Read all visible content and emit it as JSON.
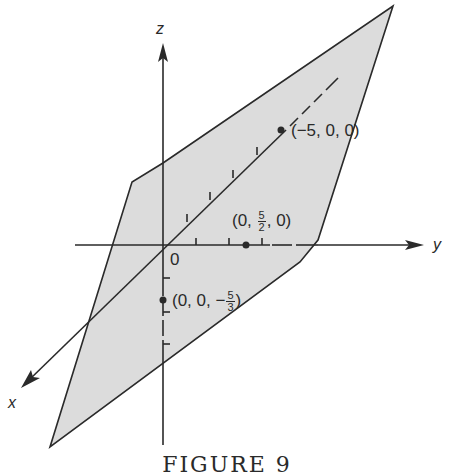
{
  "figure": {
    "caption": "FIGURE 9",
    "colors": {
      "plane_fill": "#dcdcdc",
      "line": "#2a2a2a",
      "background": "#ffffff"
    },
    "axes": {
      "x": {
        "label": "x"
      },
      "y": {
        "label": "y"
      },
      "z": {
        "label": "z"
      }
    },
    "origin_label": "0",
    "points": [
      {
        "id": "x-intercept",
        "label_prefix": "(−5, 0, 0)",
        "coords": [
          -5,
          0,
          0
        ]
      },
      {
        "id": "y-intercept",
        "label_prefix": "(0, ",
        "label_num": "5",
        "label_den": "2",
        "label_suffix": ", 0)",
        "coords": [
          0,
          2.5,
          0
        ]
      },
      {
        "id": "z-intercept",
        "label_prefix": "(0, 0, −",
        "label_num": "5",
        "label_den": "3",
        "label_suffix": ")",
        "coords": [
          0,
          0,
          -1.6667
        ]
      }
    ]
  }
}
